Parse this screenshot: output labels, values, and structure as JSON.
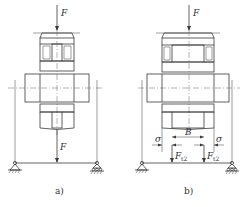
{
  "figure": {
    "panels": [
      {
        "id": "a",
        "caption": "a)",
        "force_top_label": "F",
        "force_bottom_label": "F",
        "description": "Gear with web (I-section hub) on shaft between two supports, concentrated load F at center"
      },
      {
        "id": "b",
        "caption": "b)",
        "force_top_label": "F",
        "width_label": "B",
        "sigma_left_label": "σ",
        "sigma_right_label": "σ",
        "reaction_left_label": "F",
        "reaction_left_sub": "t2",
        "reaction_right_label": "F",
        "reaction_right_sub": "t2",
        "description": "Solid gear hub of width B on shaft, load distributed as two forces F_t2 with offsets σ"
      }
    ],
    "colors": {
      "line": "#3a3a3a",
      "hatch": "#555555",
      "background": "#ffffff"
    }
  }
}
